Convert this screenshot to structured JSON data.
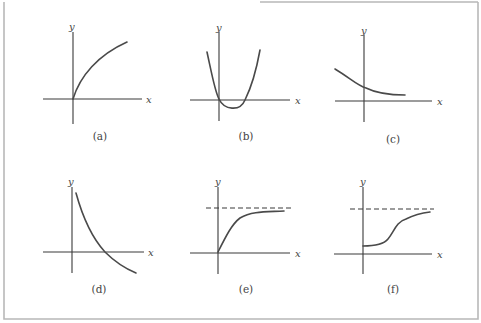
{
  "figure": {
    "panels": [
      {
        "id": "a",
        "caption": "(a)",
        "x_label": "x",
        "y_label": "y",
        "description": "increasing concave-down curve starting at origin",
        "has_asymptote": false
      },
      {
        "id": "b",
        "caption": "(b)",
        "x_label": "x",
        "y_label": "y",
        "description": "upward parabola through origin with minimum below x-axis, crossing x-axis twice",
        "has_asymptote": false
      },
      {
        "id": "c",
        "caption": "(c)",
        "x_label": "x",
        "y_label": "y",
        "description": "decreasing curve leveling off above x-axis",
        "has_asymptote": false
      },
      {
        "id": "d",
        "caption": "(d)",
        "x_label": "x",
        "y_label": "y",
        "description": "decreasing convex curve crossing x-axis",
        "has_asymptote": false
      },
      {
        "id": "e",
        "caption": "(e)",
        "x_label": "x",
        "y_label": "y",
        "description": "increasing from origin approaching horizontal dashed asymptote",
        "has_asymptote": true
      },
      {
        "id": "f",
        "caption": "(f)",
        "x_label": "x",
        "y_label": "y",
        "description": "S-shaped logistic curve from positive y-intercept approaching horizontal dashed asymptote",
        "has_asymptote": true
      }
    ]
  }
}
